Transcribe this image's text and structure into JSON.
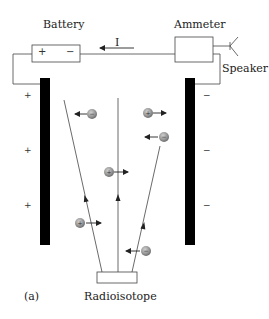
{
  "figure": {
    "caption": "(a)",
    "current_label": "I"
  },
  "components": {
    "battery": {
      "label": "Battery",
      "positive": "+",
      "negative": "−"
    },
    "ammeter": {
      "label": "Ammeter"
    },
    "speaker": {
      "label": "Speaker"
    },
    "source": {
      "label": "Radioisotope"
    }
  },
  "plates": {
    "left": {
      "charge_signs": [
        "+",
        "+",
        "+"
      ]
    },
    "right": {
      "charge_signs": [
        "−",
        "−",
        "−"
      ]
    }
  },
  "ions": [
    {
      "charge": "−",
      "direction": "left"
    },
    {
      "charge": "+",
      "direction": "right"
    },
    {
      "charge": "−",
      "direction": "left"
    },
    {
      "charge": "+",
      "direction": "right"
    },
    {
      "charge": "+",
      "direction": "right"
    },
    {
      "charge": "−",
      "direction": "left"
    }
  ],
  "colors": {
    "plate": "#000000",
    "wire": "#444444",
    "ion": "#9a9a9a"
  }
}
